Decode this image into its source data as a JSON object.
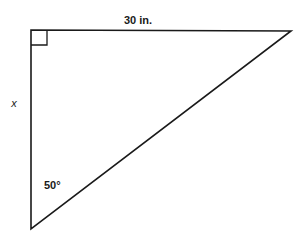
{
  "diagram": {
    "type": "right-triangle",
    "labels": {
      "top_side": "30 in.",
      "left_side": "x",
      "angle": "50°"
    },
    "colors": {
      "stroke": "#1a1a1a",
      "background": "#ffffff"
    }
  }
}
